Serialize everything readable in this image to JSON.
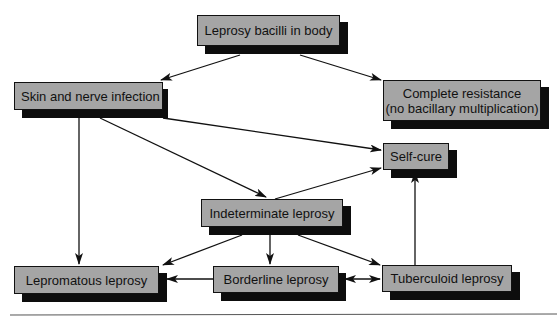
{
  "diagram": {
    "type": "flowchart",
    "nodes": [
      {
        "id": "bacilli",
        "label": "Leprosy bacilli in body"
      },
      {
        "id": "skin",
        "label": "Skin and nerve infection"
      },
      {
        "id": "resistance",
        "label": "Complete resistance\n(no bacillary multiplication)",
        "line1": "Complete resistance",
        "line2": "(no bacillary multiplication)"
      },
      {
        "id": "selfcure",
        "label": "Self-cure"
      },
      {
        "id": "indeterminate",
        "label": "Indeterminate leprosy"
      },
      {
        "id": "lepromatous",
        "label": "Lepromatous leprosy"
      },
      {
        "id": "borderline",
        "label": "Borderline leprosy"
      },
      {
        "id": "tuberculoid",
        "label": "Tuberculoid leprosy"
      }
    ],
    "edges": [
      {
        "from": "bacilli",
        "to": "skin"
      },
      {
        "from": "bacilli",
        "to": "resistance"
      },
      {
        "from": "skin",
        "to": "selfcure"
      },
      {
        "from": "skin",
        "to": "indeterminate"
      },
      {
        "from": "skin",
        "to": "lepromatous"
      },
      {
        "from": "indeterminate",
        "to": "selfcure"
      },
      {
        "from": "indeterminate",
        "to": "lepromatous"
      },
      {
        "from": "indeterminate",
        "to": "borderline"
      },
      {
        "from": "indeterminate",
        "to": "tuberculoid"
      },
      {
        "from": "borderline",
        "to": "lepromatous"
      },
      {
        "from": "borderline",
        "to": "tuberculoid",
        "bidirectional": true
      },
      {
        "from": "tuberculoid",
        "to": "selfcure"
      }
    ],
    "colors": {
      "box_fill": "#a5a5a5",
      "shadow": "#0d0d0d",
      "line": "#111111"
    }
  }
}
